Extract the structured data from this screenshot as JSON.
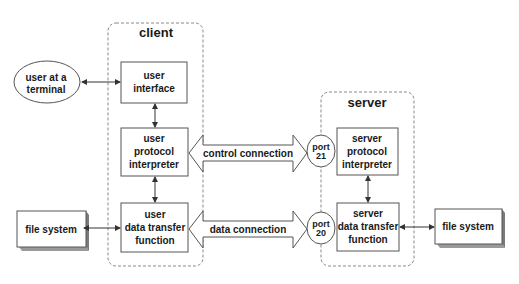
{
  "diagram": {
    "client": {
      "label": "client",
      "user_interface": [
        "user",
        "interface"
      ],
      "user_pi": [
        "user",
        "protocol",
        "interpreter"
      ],
      "user_dtp": [
        "user",
        "data transfer",
        "function"
      ]
    },
    "server": {
      "label": "server",
      "server_pi": [
        "server",
        "protocol",
        "interpreter"
      ],
      "server_dtp": [
        "server",
        "data transfer",
        "function"
      ]
    },
    "user_terminal": [
      "user at a",
      "terminal"
    ],
    "file_system_left": "file system",
    "file_system_right": "file system",
    "connections": {
      "control": "control connection",
      "data": "data connection"
    },
    "ports": {
      "control": [
        "port",
        "21"
      ],
      "data": [
        "port",
        "20"
      ]
    },
    "colors": {
      "line": "#444444",
      "text": "#1a1a1a",
      "box_fill": "#ffffff",
      "shadow": "#8a8a8a",
      "dashed": "#888888"
    }
  }
}
